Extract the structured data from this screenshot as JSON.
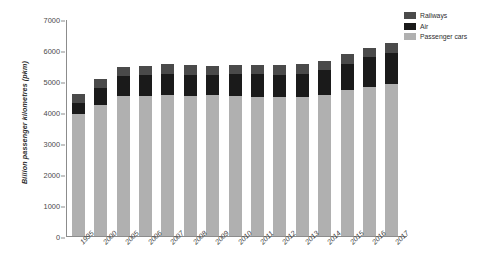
{
  "chart_data": {
    "type": "bar",
    "stacked": true,
    "title": "",
    "subtitle": "",
    "xlabel": "",
    "ylabel": "Billion passenger kilometres (pkm)",
    "ylim": [
      0,
      7000
    ],
    "yticks": [
      0,
      1000,
      2000,
      3000,
      4000,
      5000,
      6000,
      7000
    ],
    "grid": false,
    "legend_position": "top-right",
    "categories": [
      "1995",
      "2000",
      "2005",
      "2006",
      "2007",
      "2008",
      "2009",
      "2010",
      "2011",
      "2012",
      "2013",
      "2014",
      "2015",
      "2016",
      "2017"
    ],
    "series": [
      {
        "name": "Passenger cars",
        "color": "#b0b0b0",
        "values": [
          3950,
          4240,
          4520,
          4520,
          4540,
          4520,
          4540,
          4520,
          4500,
          4480,
          4500,
          4560,
          4700,
          4820,
          4900
        ]
      },
      {
        "name": "Air",
        "color": "#1a1a1a",
        "values": [
          330,
          520,
          640,
          670,
          700,
          690,
          670,
          700,
          720,
          720,
          740,
          780,
          850,
          940,
          1010
        ]
      },
      {
        "name": "Railways",
        "color": "#4a4a4a",
        "values": [
          300,
          300,
          300,
          300,
          300,
          300,
          290,
          300,
          310,
          310,
          310,
          310,
          320,
          320,
          330
        ]
      }
    ],
    "totals": [
      4580,
      5060,
      5460,
      5490,
      5540,
      5510,
      5500,
      5520,
      5530,
      5510,
      5550,
      5650,
      5870,
      6080,
      6240
    ]
  },
  "legend": {
    "items": [
      {
        "label": "Railways",
        "color": "#4a4a4a",
        "swatch": "railways-swatch"
      },
      {
        "label": "Air",
        "color": "#1a1a1a",
        "swatch": "air-swatch"
      },
      {
        "label": "Passenger cars",
        "color": "#b0b0b0",
        "swatch": "passenger-cars-swatch"
      }
    ]
  }
}
